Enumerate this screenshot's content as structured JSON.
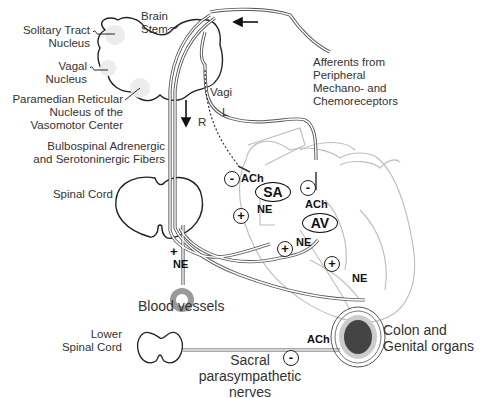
{
  "figure": {
    "brain": {
      "brain_stem": "Brain\nStem",
      "solitary_tract": "Solitary Tract\nNucleus",
      "vagal_nucleus": "Vagal\nNucleus",
      "paramedian": "Paramedian Reticular\nNucleus of the\nVasomotor Center"
    },
    "afferents": "Afferents from\nPeripheral\nMechano- and\nChemoreceptors",
    "vagi": "Vagi",
    "vagus_left": "L",
    "vagus_right": "R",
    "bulbospinal": "Bulbospinal Adrenergic\nand Serotoninergic Fibers",
    "spinal_cord": "Spinal Cord",
    "heart": {
      "sa_node": "SA",
      "av_node": "AV",
      "ach_sa": "ACh",
      "ach_av": "ACh",
      "ne_sa": "NE",
      "ne_av": "NE",
      "ne_ventricle": "NE",
      "minus_sa": "-",
      "minus_av": "-",
      "plus_sa": "+",
      "plus_av": "+",
      "plus_ventricle": "+"
    },
    "vessels": {
      "plus": "+",
      "ne": "NE",
      "label": "Blood vessels"
    },
    "pelvic": {
      "lower_spinal_cord": "Lower\nSpinal Cord",
      "sacral": "Sacral\nparasympathetic\nnerves",
      "minus": "-",
      "ach": "ACh",
      "target": "Colon and\nGenital organs"
    }
  }
}
